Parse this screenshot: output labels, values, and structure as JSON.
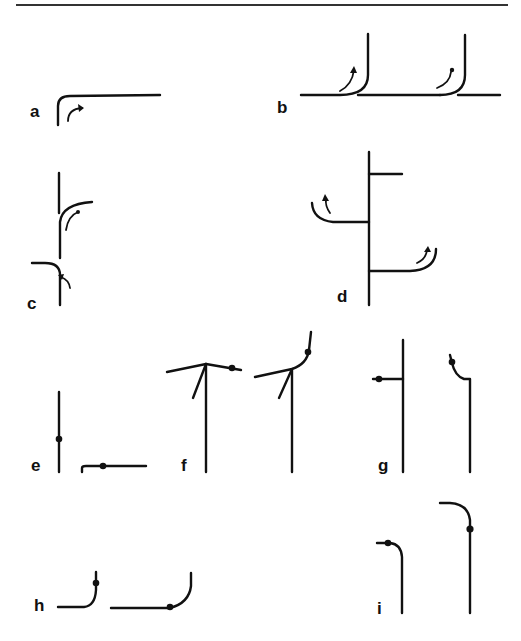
{
  "figure": {
    "colors": {
      "ink": "#111111",
      "background": "#ffffff",
      "rule": "#333333"
    },
    "panels": [
      {
        "id": "a",
        "label": "a",
        "description": "Single corner bend from vertical to horizontal with curved arrow indicating rotation"
      },
      {
        "id": "b",
        "label": "b",
        "description": "Two horizontal-to-vertical bends along a baseline, each with curved arrow"
      },
      {
        "id": "c",
        "label": "c",
        "description": "Vertical stem with upper bend curving right and lower bend curving left, each with arrow"
      },
      {
        "id": "d",
        "label": "d",
        "description": "Vertical axis with three side branches; two branches curve upward with arrows"
      },
      {
        "id": "e",
        "label": "e",
        "description": "Vertical line with a dot and small hooked horizontal line with a dot"
      },
      {
        "id": "f",
        "label": "f",
        "description": "Two vertical stems with inclined crossbars and diagonal struts; dots on crossbar ends"
      },
      {
        "id": "g",
        "label": "g",
        "description": "Vertical line with short dotted side branch; second vertical with curved dotted top"
      },
      {
        "id": "h",
        "label": "h",
        "description": "Two horizontal lines curving upward at the end, each with a dot"
      },
      {
        "id": "i",
        "label": "i",
        "description": "Two vertical lines curving left at the top, each with a dot"
      }
    ]
  }
}
